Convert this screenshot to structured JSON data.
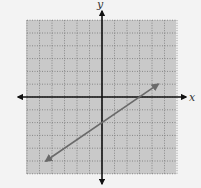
{
  "chart_data": {
    "type": "line",
    "title": "",
    "xlabel": "x",
    "ylabel": "y",
    "xlim": [
      -6,
      6
    ],
    "ylim": [
      -6,
      6
    ],
    "grid": true,
    "grid_step": 1,
    "tick_labels": false,
    "series": [
      {
        "name": "line",
        "equation": "y = (2/3)x - 2",
        "x": [
          -4.5,
          4.5
        ],
        "y": [
          -5,
          1
        ],
        "arrows_both_ends": true,
        "y_intercept": -2,
        "x_intercept": 3
      }
    ]
  },
  "colors": {
    "background": "#f3f3f3",
    "plot_area": "#c9c9c9",
    "gridline": "#777777",
    "axis": "#111111",
    "line": "#6a6a6a"
  },
  "labels": {
    "x_axis": "x",
    "y_axis": "y"
  }
}
